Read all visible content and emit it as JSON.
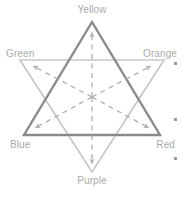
{
  "diagram": {
    "type": "hexagram-color-relationship",
    "labels": {
      "yellow": "Yellow",
      "green": "Green",
      "orange": "Orange",
      "blue": "Blue",
      "red": "Red",
      "purple": "Purple"
    },
    "colors": {
      "primary_triangle_stroke": "#8a8a8a",
      "secondary_triangle_stroke": "#c8c8c8",
      "arrow_stroke": "#b0b0b0",
      "label_text": "#aaaaaa",
      "dot": "#9a9a9a",
      "background": "#ffffff"
    },
    "triangles": [
      {
        "name": "primary-triangle",
        "orientation": "up",
        "vertices": [
          "yellow",
          "blue",
          "red"
        ],
        "stroke": "#8a8a8a",
        "stroke_width": 2.4
      },
      {
        "name": "secondary-triangle",
        "orientation": "down",
        "vertices": [
          "green",
          "orange",
          "purple"
        ],
        "stroke": "#c8c8c8",
        "stroke_width": 1.6
      }
    ],
    "center": {
      "x": 92,
      "y": 97
    },
    "vertex_points": [
      {
        "name": "yellow",
        "x": 92,
        "y": 22
      },
      {
        "name": "green",
        "x": 20,
        "y": 60
      },
      {
        "name": "orange",
        "x": 164,
        "y": 60
      },
      {
        "name": "blue",
        "x": 24,
        "y": 135
      },
      {
        "name": "red",
        "x": 160,
        "y": 135
      },
      {
        "name": "purple",
        "x": 92,
        "y": 172
      }
    ],
    "arrows": {
      "count": 6,
      "style": "dashed",
      "direction": "outward-from-center",
      "targets": [
        "yellow",
        "green",
        "orange",
        "blue",
        "red",
        "purple"
      ]
    },
    "side_markers": [
      {
        "name": "bullet-dot-1",
        "x": 175,
        "y": 63
      },
      {
        "name": "bullet-dot-2",
        "x": 175,
        "y": 119
      },
      {
        "name": "bullet-dot-3",
        "x": 175,
        "y": 158
      }
    ]
  }
}
